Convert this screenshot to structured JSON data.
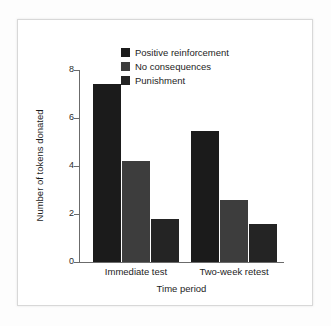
{
  "figure": {
    "background_color": "#ffffff",
    "frame_color": "#d8d8d8",
    "axis_color": "#6b6b6b"
  },
  "legend": {
    "position": "upper-center",
    "entries": [
      {
        "label": "Positive reinforcement",
        "color": "#1b1b1b"
      },
      {
        "label": "No consequences",
        "color": "#3d3d3d"
      },
      {
        "label": "Punishment",
        "color": "#242424"
      }
    ]
  },
  "axes": {
    "y_tick_labels": [
      "0",
      "2",
      "4",
      "6",
      "8"
    ],
    "x_tick_labels": [
      "Immediate test",
      "Two-week retest"
    ]
  },
  "chart_data": {
    "type": "bar",
    "title": "",
    "subtitle": "",
    "xlabel": "Time period",
    "ylabel": "Number of tokens donated",
    "categories": [
      "Immediate test",
      "Two-week retest"
    ],
    "series": [
      {
        "name": "Positive reinforcement",
        "color": "#1b1b1b",
        "values": [
          7.4,
          5.45
        ]
      },
      {
        "name": "No consequences",
        "color": "#3d3d3d",
        "values": [
          4.2,
          2.6
        ]
      },
      {
        "name": "Punishment",
        "color": "#242424",
        "values": [
          1.8,
          1.6
        ]
      }
    ],
    "ylim": [
      0,
      8
    ],
    "yticks": [
      0,
      2,
      4,
      6,
      8
    ],
    "grid": false,
    "legend_position": "upper center"
  }
}
